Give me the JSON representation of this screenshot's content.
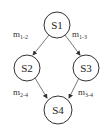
{
  "diagram": {
    "type": "state-graph",
    "nodes": [
      {
        "id": "S1",
        "label": "S1",
        "cx": 57,
        "cy": 25,
        "r": 13
      },
      {
        "id": "S2",
        "label": "S2",
        "cx": 27,
        "cy": 68,
        "r": 13
      },
      {
        "id": "S3",
        "label": "S3",
        "cx": 86,
        "cy": 68,
        "r": 13
      },
      {
        "id": "S4",
        "label": "S4",
        "cx": 58,
        "cy": 108,
        "r": 14
      }
    ],
    "edges": [
      {
        "from": "S1",
        "to": "S2",
        "label_main": "m",
        "label_sub": "1-2"
      },
      {
        "from": "S1",
        "to": "S3",
        "label_main": "m",
        "label_sub": "1-3"
      },
      {
        "from": "S2",
        "to": "S4",
        "label_main": "m",
        "label_sub": "2-4"
      },
      {
        "from": "S3",
        "to": "S4",
        "label_main": "m",
        "label_sub": "3-4"
      }
    ],
    "colors": {
      "stroke": "#333333",
      "background": "#ffffff"
    }
  }
}
